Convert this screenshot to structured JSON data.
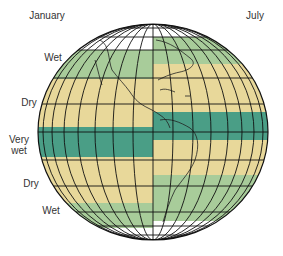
{
  "header": {
    "left_title": "January",
    "right_title": "July"
  },
  "zone_labels": [
    {
      "text": "Wet",
      "line2": ""
    },
    {
      "text": "Dry",
      "line2": ""
    },
    {
      "text": "Very",
      "line2": "wet"
    },
    {
      "text": "Dry",
      "line2": ""
    },
    {
      "text": "Wet",
      "line2": ""
    }
  ],
  "colors": {
    "very_wet": "#4a9e86",
    "wet": "#a8cc9a",
    "dry": "#e8d89a",
    "none": "#ffffff",
    "grid": "#111111"
  },
  "bands": {
    "january": [
      {
        "zone": "none",
        "y0": 24,
        "y1": 50
      },
      {
        "zone": "wet",
        "y0": 50,
        "y1": 79
      },
      {
        "zone": "dry",
        "y0": 79,
        "y1": 127
      },
      {
        "zone": "very_wet",
        "y0": 127,
        "y1": 157
      },
      {
        "zone": "dry",
        "y0": 157,
        "y1": 203
      },
      {
        "zone": "wet",
        "y0": 203,
        "y1": 228
      },
      {
        "zone": "none",
        "y0": 228,
        "y1": 240
      }
    ],
    "july": [
      {
        "zone": "none",
        "y0": 24,
        "y1": 37
      },
      {
        "zone": "wet",
        "y0": 37,
        "y1": 64
      },
      {
        "zone": "dry",
        "y0": 64,
        "y1": 112
      },
      {
        "zone": "very_wet",
        "y0": 112,
        "y1": 140
      },
      {
        "zone": "dry",
        "y0": 140,
        "y1": 175
      },
      {
        "zone": "wet",
        "y0": 175,
        "y1": 221
      },
      {
        "zone": "none",
        "y0": 221,
        "y1": 240
      }
    ]
  }
}
